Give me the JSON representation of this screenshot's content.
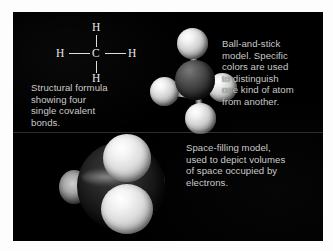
{
  "figure": {
    "background_color": "#000000",
    "mat_color": "#fdfdfd",
    "text_color": "#c9c9c9"
  },
  "structural_formula": {
    "atom_h_top": "H",
    "atom_h_left": "H",
    "atom_c_center": "C",
    "atom_h_right": "H",
    "atom_h_bottom": "H"
  },
  "captions": {
    "structural": "Structural formula\nshowing four\nsingle covalent\nbonds.",
    "ball_and_stick": "Ball-and-stick\nmodel. Specific\ncolors are used\nto distinguish\none kind of atom\nfrom another.",
    "space_filling": "Space-filling model,\nused to depict volumes\nof space occupied by\nelectrons."
  },
  "models": {
    "ball_and_stick": {
      "carbon_label": "carbon-atom-sphere",
      "hydrogen_labels": [
        "hydrogen-atom-sphere-top",
        "hydrogen-atom-sphere-left",
        "hydrogen-atom-sphere-right",
        "hydrogen-atom-sphere-bottom"
      ],
      "carbon_color": "#414141",
      "hydrogen_color": "#e8e8e8"
    },
    "space_filling": {
      "carbon_color": "#181818",
      "hydrogen_color": "#e0e0e0"
    }
  }
}
